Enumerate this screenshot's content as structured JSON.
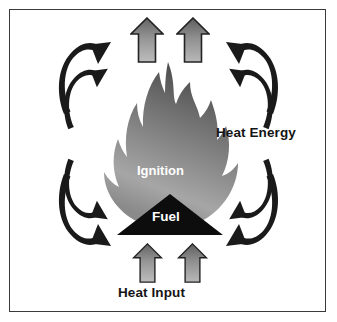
{
  "diagram": {
    "labels": {
      "heat_energy": "Heat Energy",
      "heat_input": "Heat Input",
      "ignition": "Ignition",
      "fuel": "Fuel"
    },
    "colors": {
      "background": "#ffffff",
      "border": "#3a3a3c",
      "arrow_black": "#1a1a1a",
      "flame_light": "#a8a8a8",
      "flame_dark": "#4e4e4e",
      "fuel_triangle": "#0d0d0d",
      "heat_arrow_light": "#b4b4b4",
      "heat_arrow_dark": "#646464",
      "label_text": "#141414",
      "inverse_text": "#ffffff"
    },
    "elements": {
      "flame": "flame-shape",
      "fuel_triangle": "triangle-shape",
      "heat_input_arrows": "up-arrow-icon",
      "heat_output_arrows": "up-arrow-icon",
      "radiating_arrows": "curved-arrow-icon"
    },
    "counts": {
      "top_up_arrows": 2,
      "bottom_up_arrows": 2,
      "curved_arrow_pairs": 4,
      "curved_arrows_total": 8
    }
  }
}
